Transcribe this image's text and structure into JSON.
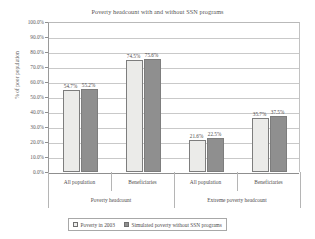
{
  "chart_data": {
    "type": "bar",
    "title": "Poverty headcount with and without SSN programs",
    "xlabel": "",
    "ylabel": "% of poor population",
    "ylim": [
      0,
      100
    ],
    "ytick_labels": [
      "100.0%",
      "90.0%",
      "80.0%",
      "70.0%",
      "60.0%",
      "50.0%",
      "40.0%",
      "30.0%",
      "20.0%",
      "10.0%",
      "0.0%"
    ],
    "ytick_values": [
      100,
      90,
      80,
      70,
      60,
      50,
      40,
      30,
      20,
      10,
      0
    ],
    "grid": true,
    "legend_position": "bottom",
    "categories": [
      "All population",
      "Beneficiaries",
      "All population",
      "Beneficiaries"
    ],
    "groups": [
      {
        "label": "Poverty headcount",
        "categories": [
          "All population",
          "Beneficiaries"
        ]
      },
      {
        "label": "Extreme poverty headcount",
        "categories": [
          "All population",
          "Beneficiaries"
        ]
      }
    ],
    "series": [
      {
        "name": "Poverty in 2003",
        "color": "#ebebe9",
        "values": [
          54.7,
          74.5,
          21.6,
          35.7
        ],
        "labels": [
          "54.7%",
          "74.5%",
          "21.6%",
          "35.7%"
        ]
      },
      {
        "name": "Simulated poverty without SSN programs",
        "color": "#8f8f8f",
        "values": [
          55.2,
          75.6,
          22.5,
          37.5
        ],
        "labels": [
          "55.2%",
          "75.6%",
          "22.5%",
          "37.5%"
        ]
      }
    ]
  }
}
